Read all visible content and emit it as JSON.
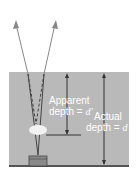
{
  "labels": {
    "apparent_line1": "Apparent",
    "apparent_line2": "depth = ",
    "apparent_var": "d'",
    "actual_line1": "Actual",
    "actual_line2": "depth = ",
    "actual_var": "d"
  },
  "colors": {
    "water": "#b9b9b9",
    "ray": "#888888",
    "arrow": "#333333"
  }
}
